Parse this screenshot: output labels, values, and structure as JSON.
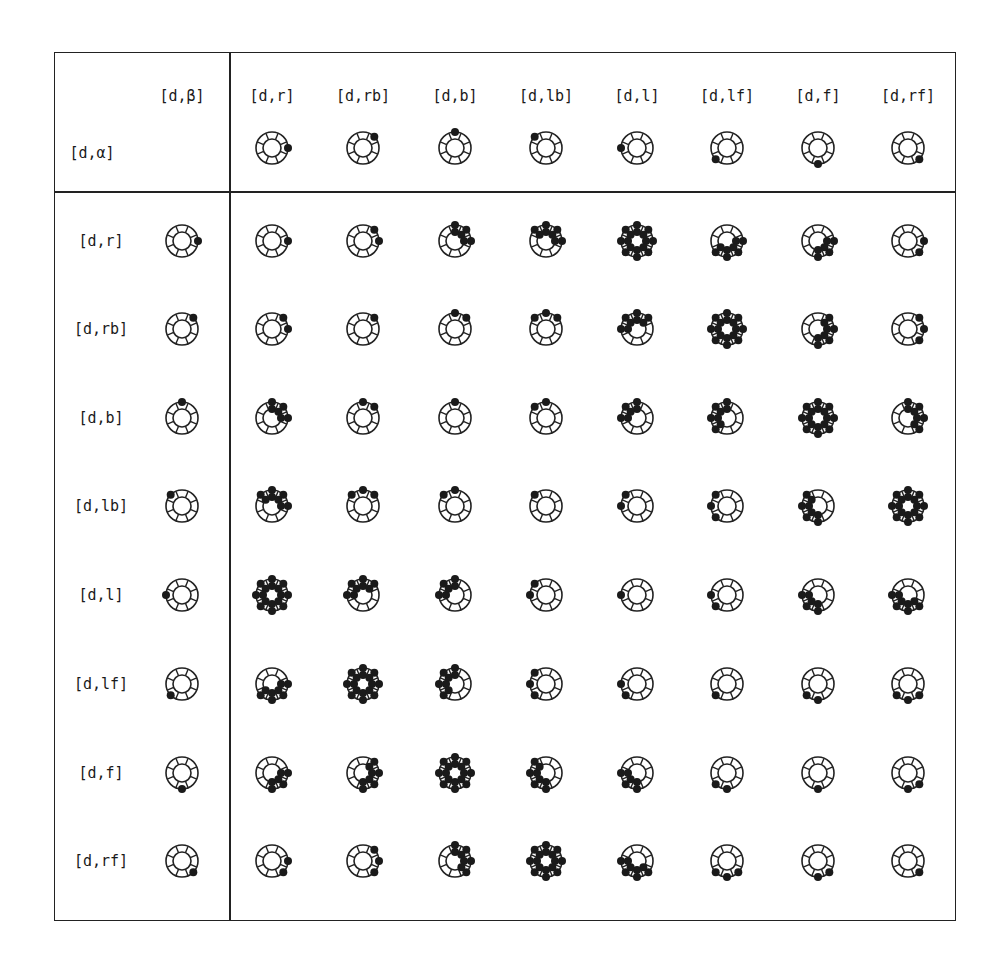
{
  "corner": {
    "alpha_label": "[d,α]",
    "beta_label": "[d,β]"
  },
  "directions": [
    "r",
    "rb",
    "b",
    "lb",
    "l",
    "lf",
    "f",
    "rf"
  ],
  "column_headers": [
    {
      "label": "[d,r]",
      "dir": 0
    },
    {
      "label": "[d,rb]",
      "dir": 1
    },
    {
      "label": "[d,b]",
      "dir": 2
    },
    {
      "label": "[d,lb]",
      "dir": 3
    },
    {
      "label": "[d,l]",
      "dir": 4
    },
    {
      "label": "[d,lf]",
      "dir": 5
    },
    {
      "label": "[d,f]",
      "dir": 6
    },
    {
      "label": "[d,rf]",
      "dir": 7
    }
  ],
  "row_headers": [
    {
      "label": "[d,r]",
      "dir": 0
    },
    {
      "label": "[d,rb]",
      "dir": 1
    },
    {
      "label": "[d,b]",
      "dir": 2
    },
    {
      "label": "[d,lb]",
      "dir": 3
    },
    {
      "label": "[d,l]",
      "dir": 4
    },
    {
      "label": "[d,lf]",
      "dir": 5
    },
    {
      "label": "[d,f]",
      "dir": 6
    },
    {
      "label": "[d,rf]",
      "dir": 7
    }
  ],
  "glyph_rule": "d=arc distance(alpha,beta); d=0 single outer dot; d=1 outer dots at both; d=2 outer arc (+inner arc if alpha is axis-aligned r/b/l/f); d=3 outer+inner arc; d=4 full ring outer+inner",
  "colors": {
    "line": "#222222",
    "dot": "#1a1a1a",
    "background": "#ffffff"
  }
}
